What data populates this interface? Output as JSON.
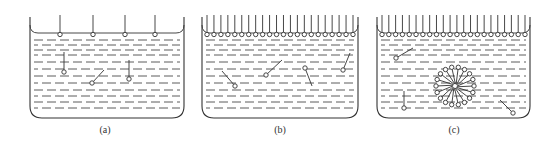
{
  "figure": {
    "stroke_color": "#333333",
    "background": "#ffffff"
  },
  "panels": [
    {
      "id": "a",
      "label": "(a)",
      "label_x": 105,
      "container": {
        "x1": 30,
        "x2": 184,
        "top": 17,
        "surface": 33,
        "bottom": 118,
        "radius": 12
      },
      "surface_molecules_x": [
        60,
        93,
        125,
        155
      ],
      "bulk_molecules": [
        {
          "head": [
            64,
            72
          ],
          "tail": [
            64,
            52
          ]
        },
        {
          "head": [
            92,
            83
          ],
          "tail": [
            104,
            70
          ]
        },
        {
          "head": [
            129,
            79
          ],
          "tail": [
            129,
            60
          ]
        }
      ],
      "micelle": null
    },
    {
      "id": "b",
      "label": "(b)",
      "label_x": 280,
      "container": {
        "x1": 202,
        "x2": 358,
        "top": 17,
        "surface": 33,
        "bottom": 118,
        "radius": 12
      },
      "surface_molecules_count": 22,
      "bulk_molecules": [
        {
          "head": [
            235,
            86
          ],
          "tail": [
            222,
            71
          ]
        },
        {
          "head": [
            266,
            75
          ],
          "tail": [
            282,
            60
          ]
        },
        {
          "head": [
            305,
            68
          ],
          "tail": [
            312,
            86
          ]
        },
        {
          "head": [
            343,
            70
          ],
          "tail": [
            350,
            53
          ]
        }
      ],
      "micelle": null
    },
    {
      "id": "c",
      "label": "(c)",
      "label_x": 454,
      "container": {
        "x1": 377,
        "x2": 530,
        "top": 17,
        "surface": 33,
        "bottom": 118,
        "radius": 12
      },
      "surface_molecules_count": 22,
      "bulk_molecules": [
        {
          "head": [
            396,
            58
          ],
          "tail": [
            413,
            48
          ]
        },
        {
          "head": [
            404,
            108
          ],
          "tail": [
            404,
            91
          ]
        },
        {
          "head": [
            513,
            113
          ],
          "tail": [
            500,
            100
          ]
        }
      ],
      "micelle": {
        "cx": 455,
        "cy": 86,
        "r": 19,
        "count": 18
      }
    }
  ],
  "liquid_lines_y": [
    40,
    45,
    50,
    55,
    62,
    69,
    76,
    83,
    90,
    96,
    102,
    108
  ]
}
